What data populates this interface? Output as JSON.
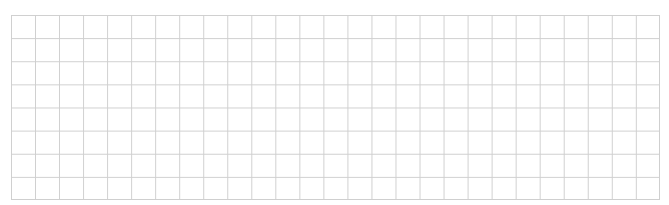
{
  "grid": {
    "columns": 27,
    "rows": 8,
    "line_color": "#cfcfcf",
    "background": "#ffffff"
  }
}
